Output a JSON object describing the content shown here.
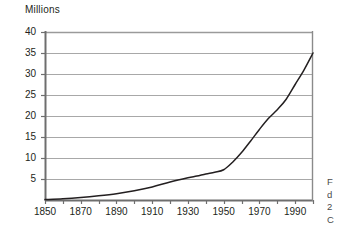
{
  "chart_data": {
    "type": "line",
    "title": "",
    "ylabel": "Millions",
    "xlabel": "",
    "ylim": [
      0,
      40
    ],
    "xlim": [
      1850,
      2000
    ],
    "grid": true,
    "legend": "none",
    "ytick_labels": [
      "40",
      "35",
      "30",
      "25",
      "20",
      "15",
      "10",
      "5"
    ],
    "ytick_values": [
      40,
      35,
      30,
      25,
      20,
      15,
      10,
      5
    ],
    "xtick_labels": [
      "1850",
      "1870",
      "1890",
      "1910",
      "1930",
      "1950",
      "1970",
      "1990"
    ],
    "xtick_values": [
      1850,
      1870,
      1890,
      1910,
      1930,
      1950,
      1970,
      1990
    ],
    "minor_xtick_step": 10,
    "series": [
      {
        "name": "Population",
        "color": "#231f20",
        "x": [
          1850,
          1860,
          1870,
          1880,
          1890,
          1900,
          1910,
          1920,
          1930,
          1935,
          1940,
          1945,
          1950,
          1955,
          1960,
          1965,
          1970,
          1975,
          1980,
          1985,
          1990,
          1995,
          2000
        ],
        "values": [
          0.1,
          0.3,
          0.6,
          1.0,
          1.5,
          2.2,
          3.1,
          4.3,
          5.3,
          5.7,
          6.2,
          6.6,
          7.2,
          9.0,
          11.3,
          14.0,
          16.8,
          19.4,
          21.5,
          24.0,
          27.5,
          31.0,
          35.0
        ]
      }
    ]
  },
  "margin_text": {
    "line1": "F",
    "line2": "d",
    "line3": "2",
    "line4": "C"
  },
  "colors": {
    "axis": "#6e6e6e",
    "grid": "#a8a8a8",
    "curve": "#231f20",
    "text": "#231f20",
    "background": "#ffffff"
  }
}
